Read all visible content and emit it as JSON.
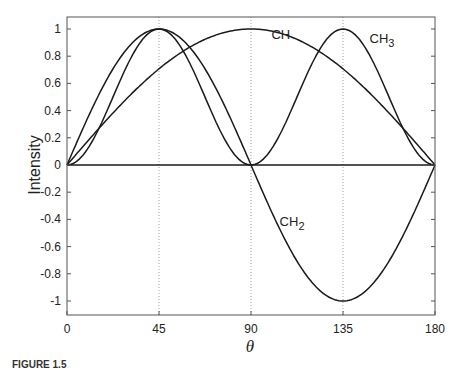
{
  "chart_data": {
    "type": "line",
    "title": "",
    "xlabel": "θ",
    "ylabel": "Intensity",
    "xlim": [
      0,
      180
    ],
    "ylim": [
      -1.1,
      1.1
    ],
    "grid": "vertical dotted lines at 45, 90, 135",
    "x_ticks": [
      0,
      45,
      90,
      135,
      180
    ],
    "x_tick_labels": [
      "0",
      "45",
      "90",
      "135",
      "180"
    ],
    "y_ticks": [
      1,
      0.8,
      0.6,
      0.4,
      0.2,
      0,
      -0.2,
      -0.4,
      -0.6,
      -0.8,
      -1
    ],
    "y_tick_labels": [
      "1",
      "0.8",
      "0.6",
      "0.4",
      "0.2",
      "0",
      "-0.2",
      "-0.4",
      "-0.6",
      "-0.8",
      "-1"
    ],
    "x": [
      0,
      15,
      30,
      45,
      60,
      75,
      90,
      105,
      120,
      135,
      150,
      165,
      180
    ],
    "series": [
      {
        "name": "CH",
        "label": "CH",
        "function": "sin(θ)",
        "values": [
          0,
          0.259,
          0.5,
          0.707,
          0.866,
          0.966,
          1,
          0.966,
          0.866,
          0.707,
          0.5,
          0.259,
          0
        ]
      },
      {
        "name": "CH2",
        "label": "CH",
        "label_sub": "2",
        "function": "sin(2θ)",
        "values": [
          0,
          0.5,
          0.866,
          1,
          0.866,
          0.5,
          0,
          -0.5,
          -0.866,
          -1,
          -0.866,
          -0.5,
          0
        ]
      },
      {
        "name": "CH3",
        "label": "CH",
        "label_sub": "3",
        "function": "sin²(2θ)",
        "values": [
          0,
          0.25,
          0.75,
          1,
          0.75,
          0.25,
          0,
          0.25,
          0.75,
          1,
          0.75,
          0.25,
          0
        ]
      },
      {
        "name": "baseline",
        "label": "",
        "function": "0",
        "values": [
          0,
          0,
          0,
          0,
          0,
          0,
          0,
          0,
          0,
          0,
          0,
          0,
          0
        ]
      }
    ],
    "annotations": [
      {
        "text": "CH",
        "x": 100,
        "y": 0.93
      },
      {
        "text": "CH3",
        "x": 148,
        "y": 0.9
      },
      {
        "text": "CH2",
        "x": 104,
        "y": -0.45
      }
    ],
    "legend": "none (inline labels)"
  },
  "caption": "FIGURE 1.5"
}
